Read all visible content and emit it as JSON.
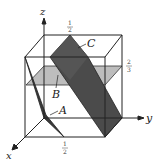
{
  "figure": {
    "axes": {
      "x": "x",
      "y": "y",
      "z": "z"
    },
    "planes": [
      {
        "label": "A",
        "fill": "#3a3a3a"
      },
      {
        "label": "B",
        "fill": "#b8b8b8"
      },
      {
        "label": "C",
        "fill": "#4a4a4a"
      }
    ],
    "tick_labels": {
      "top": {
        "num": "1",
        "den": "2"
      },
      "right": {
        "num": "2",
        "den": "3"
      },
      "bottom": {
        "num": "1",
        "den": "2"
      }
    }
  }
}
